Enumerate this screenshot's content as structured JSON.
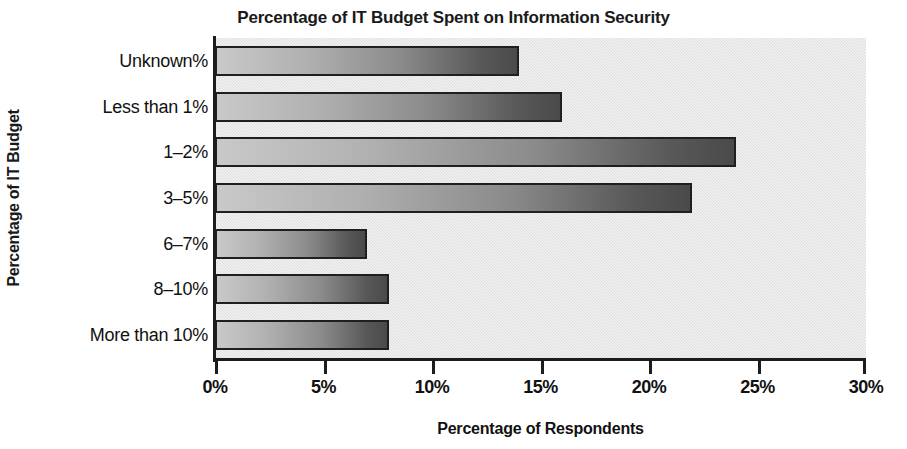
{
  "chart_data": {
    "type": "bar",
    "orientation": "horizontal",
    "title": "Percentage of IT Budget Spent on Information Security",
    "xlabel": "Percentage of Respondents",
    "ylabel": "Percentage of IT Budget",
    "categories": [
      "Unknown%",
      "Less than 1%",
      "1–2%",
      "3–5%",
      "6–7%",
      "8–10%",
      "More than 10%"
    ],
    "values": [
      14,
      16,
      24,
      22,
      7,
      8,
      8
    ],
    "value_suffix": "%",
    "xlim": [
      0,
      30
    ],
    "xtick_values": [
      0,
      5,
      10,
      15,
      20,
      25,
      30
    ],
    "xtick_labels": [
      "0%",
      "5%",
      "10%",
      "15%",
      "20%",
      "25%",
      "30%"
    ],
    "grid": false,
    "legend": "none",
    "plot_background_color": "#dddddd",
    "bar_gradient_from": "#c9c9c9",
    "bar_gradient_to": "#4a4a4a",
    "bar_border_color": "#1f1f1f",
    "axis_color": "#1c1c1c",
    "text_color": "#111111"
  }
}
